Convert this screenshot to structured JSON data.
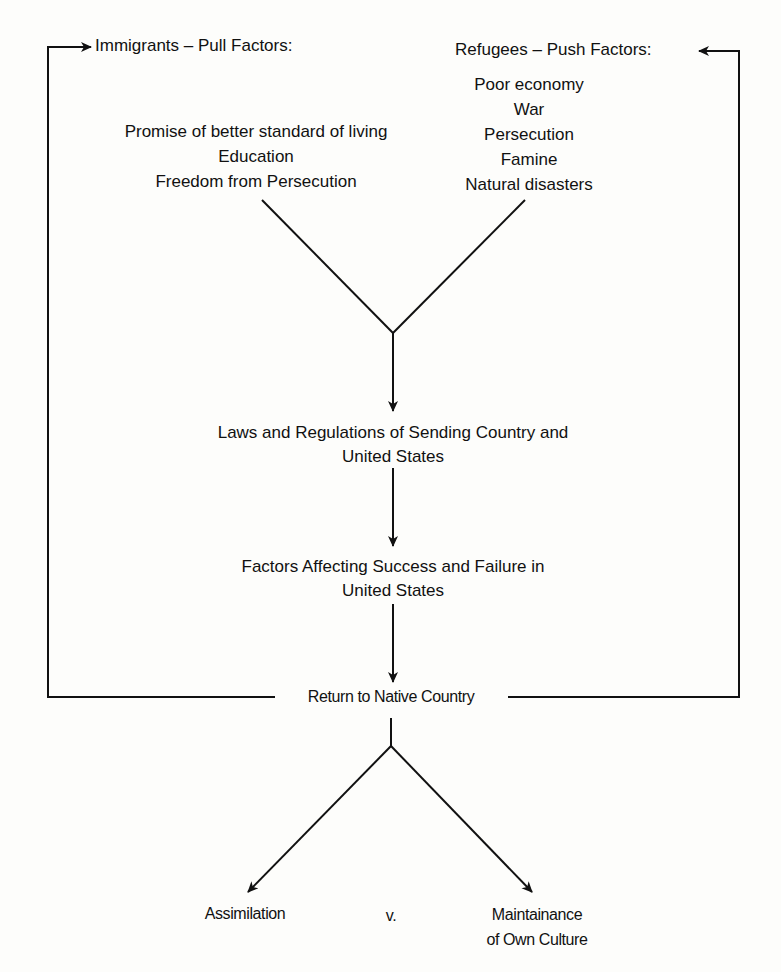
{
  "diagram": {
    "pull_header": "Immigrants – Pull Factors:",
    "pull_factors": [
      "Promise of better standard of living",
      "Education",
      "Freedom from Persecution"
    ],
    "push_header": "Refugees – Push Factors:",
    "push_factors": [
      "Poor economy",
      "War",
      "Persecution",
      "Famine",
      "Natural disasters"
    ],
    "laws": [
      "Laws and Regulations of Sending Country and",
      "United States"
    ],
    "success": [
      "Factors Affecting Success and Failure in",
      "United States"
    ],
    "return": "Return to Native Country",
    "outcome_left": "Assimilation",
    "versus": "v.",
    "outcome_right": [
      "Maintainance",
      "of Own Culture"
    ]
  }
}
